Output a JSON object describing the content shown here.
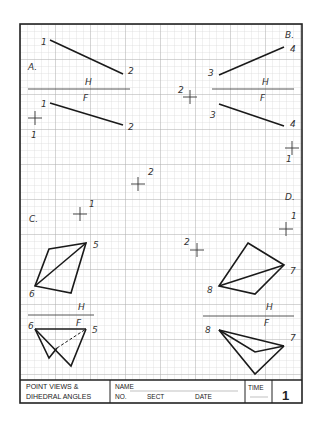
{
  "sheet": {
    "title_line1": "POINT VIEWS &",
    "title_line2": "DIHEDRAL ANGLES",
    "name_label": "NAME",
    "no_label": "NO.",
    "sect_label": "SECT",
    "date_label": "DATE",
    "time_label": "TIME",
    "sheet_number": "1"
  },
  "problems": {
    "A": {
      "label": "A.",
      "fold_top": "H",
      "fold_bottom": "F",
      "top_points": [
        "1",
        "2"
      ],
      "front_points": [
        "1",
        "2"
      ],
      "extra_point": "1"
    },
    "B": {
      "label": "B.",
      "fold_top": "H",
      "fold_bottom": "F",
      "top_points": [
        "3",
        "4"
      ],
      "front_points": [
        "3",
        "4"
      ],
      "extra_point_left": "2",
      "extra_point_right": "1"
    },
    "C": {
      "label": "C.",
      "point_1": "1",
      "point_2": "2",
      "top_points": [
        "5",
        "6"
      ],
      "fold_top": "H",
      "fold_bottom": "F",
      "front_points": [
        "6",
        "5"
      ]
    },
    "D": {
      "label": "D.",
      "point_1": "1",
      "point_2": "2",
      "top_points": [
        "7",
        "8"
      ],
      "fold_top": "H",
      "fold_bottom": "F",
      "front_points": [
        "8",
        "7"
      ]
    }
  },
  "colors": {
    "grid_minor": "#c8c8c8",
    "grid_major": "#a8a8a8",
    "ink": "#1a1a1a"
  }
}
